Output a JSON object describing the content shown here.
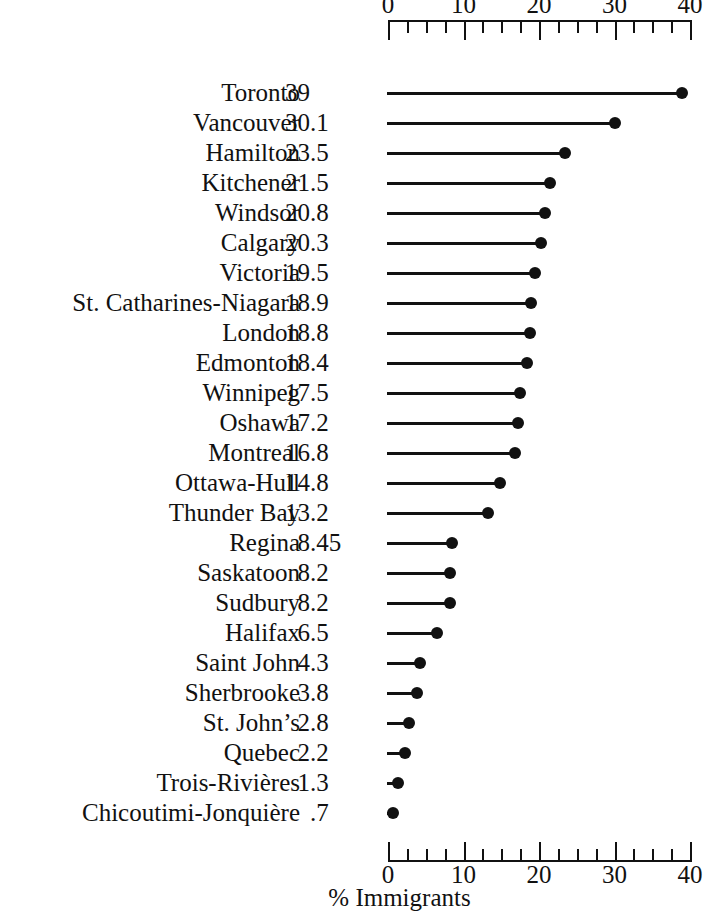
{
  "chart_data": {
    "type": "bar",
    "subtype": "dot-plot",
    "title": "",
    "xlabel": "% Immigrants",
    "ylabel": "",
    "xlim": [
      0,
      40
    ],
    "xticks": [
      0,
      10,
      20,
      30,
      40
    ],
    "xtick_labels": [
      "0",
      "10",
      "20",
      "30",
      "40"
    ],
    "minor_tick_step": 2.5,
    "grid": false,
    "legend": null,
    "value_column_shown": true,
    "categories": [
      "Toronto",
      "Vancouver",
      "Hamilton",
      "Kitchener",
      "Windsor",
      "Calgary",
      "Victoria",
      "St. Catharines-Niagara",
      "London",
      "Edmonton",
      "Winnipeg",
      "Oshawa",
      "Montreal",
      "Ottawa-Hull",
      "Thunder Bay",
      "Regina",
      "Saskatoon",
      "Sudbury",
      "Halifax",
      "Saint John",
      "Sherbrooke",
      "St. John’s",
      "Quebec",
      "Trois-Rivières",
      "Chicoutimi-Jonquière"
    ],
    "values": [
      39,
      30.1,
      23.5,
      21.5,
      20.8,
      20.3,
      19.5,
      18.9,
      18.8,
      18.4,
      17.5,
      17.2,
      16.8,
      14.8,
      13.2,
      8.45,
      8.2,
      8.2,
      6.5,
      4.3,
      3.8,
      2.8,
      2.2,
      1.3,
      0.7
    ],
    "value_labels": [
      "39",
      "30.1",
      "23.5",
      "21.5",
      "20.8",
      "20.3",
      "19.5",
      "18.9",
      "18.8",
      "18.4",
      "17.5",
      "17.2",
      "16.8",
      "14.8",
      "13.2",
      "8.45",
      "8.2",
      "8.2",
      "6.5",
      "4.3",
      "3.8",
      "2.8",
      "2.2",
      "1.3",
      ".7"
    ],
    "colors": {
      "marker": "#111111",
      "line": "#111111",
      "axis": "#111111",
      "text": "#111111",
      "background": "#ffffff"
    }
  }
}
